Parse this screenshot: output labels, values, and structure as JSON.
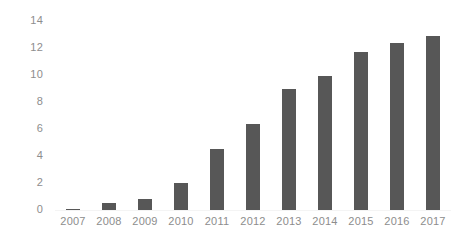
{
  "chart_data": {
    "type": "bar",
    "title": "",
    "subtitle": "",
    "xlabel": "",
    "ylabel": "",
    "categories": [
      "2007",
      "2008",
      "2009",
      "2010",
      "2011",
      "2012",
      "2013",
      "2014",
      "2015",
      "2016",
      "2017"
    ],
    "values": [
      0.1,
      0.5,
      0.8,
      2.0,
      4.5,
      6.4,
      9.0,
      9.9,
      11.7,
      12.4,
      12.9
    ],
    "series": [
      {
        "name": "",
        "values": [
          0.1,
          0.5,
          0.8,
          2.0,
          4.5,
          6.4,
          9.0,
          9.9,
          11.7,
          12.4,
          12.9
        ]
      }
    ],
    "ylim": [
      0,
      14
    ],
    "yticks": [
      0,
      2,
      4,
      6,
      8,
      10,
      12,
      14
    ],
    "ytick_labels": [
      "0",
      "2",
      "4",
      "6",
      "8",
      "10",
      "12",
      "14"
    ],
    "grid": true,
    "grid_axis": "y",
    "legend": false,
    "legend_position": "none",
    "bar_color": "#575757",
    "grid_color": "#f4f4f4",
    "tick_label_color": "#8d8d8d",
    "background_color": "#ffffff",
    "annotations": []
  }
}
